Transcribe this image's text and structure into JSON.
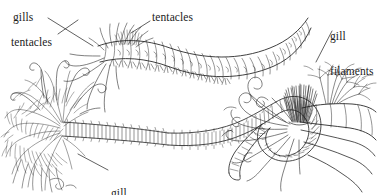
{
  "figure": {
    "background_color": "#ffffff",
    "ink_color": "#1c1c1c",
    "style": "black-and-white scientific pen-and-ink illustration"
  },
  "labels": [
    {
      "id": "gills",
      "text": "gills",
      "lines": [
        "gills"
      ],
      "x": 13,
      "y": 12,
      "leader": true
    },
    {
      "id": "tentacles-left",
      "text": "tentacles",
      "lines": [
        "tentacles"
      ],
      "x": 11,
      "y": 37,
      "leader": true
    },
    {
      "id": "tentacles-middle",
      "text": "tentacles",
      "lines": [
        "tentacles"
      ],
      "x": 152,
      "y": 12,
      "leader": true
    },
    {
      "id": "gill-filaments-right",
      "text": "gill filaments",
      "lines": [
        "gill",
        "filaments"
      ],
      "x": 330,
      "y": 7,
      "leader": true
    },
    {
      "id": "gill-filaments-bottom",
      "text": "gill filaments",
      "lines": [
        "gill",
        "filaments"
      ],
      "x": 111,
      "y": 164,
      "leader": true
    }
  ],
  "leaders": [
    {
      "id": "leader-gills",
      "x1": 48,
      "y1": 18,
      "x2": 93,
      "y2": 46
    },
    {
      "id": "leader-tentacles-left",
      "x1": 58,
      "y1": 34,
      "x2": 78,
      "y2": 20
    },
    {
      "id": "leader-tentacles-middle",
      "x1": 150,
      "y1": 21,
      "x2": 131,
      "y2": 33
    },
    {
      "id": "leader-gill-filaments-right",
      "x1": 332,
      "y1": 31,
      "x2": 316,
      "y2": 62
    },
    {
      "id": "leader-gill-filaments-bottom",
      "x1": 108,
      "y1": 170,
      "x2": 78,
      "y2": 154
    }
  ],
  "organisms": [
    {
      "id": "left-worm",
      "name": "bushy-gilled terebellid worm",
      "features": [
        "dense branched gill filament mass",
        "long tentacles",
        "segmented body"
      ]
    },
    {
      "id": "upper-worm",
      "name": "segmented polychaete with tentacular crown",
      "features": [
        "tentacles at anterior end",
        "segmented arched body",
        "parapodia"
      ]
    },
    {
      "id": "lower-worm",
      "name": "long coiled segmented worm",
      "features": [
        "looped segmented body",
        "gill filaments at anterior end"
      ]
    },
    {
      "id": "right-worm",
      "name": "tentaculate worm with bristle tuft",
      "features": [
        "coiling tentacles",
        "dark chaetal tuft",
        "branched gill filaments",
        "segmented trunk"
      ]
    }
  ]
}
